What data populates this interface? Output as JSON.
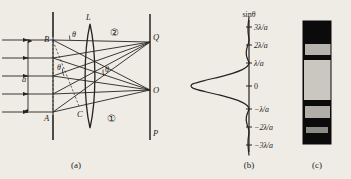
{
  "figure": {
    "background_color": "#efece6",
    "ink_color": "#262320"
  },
  "panel_a": {
    "caption": "(a)",
    "labels": {
      "slit_top": "B",
      "slit_bottom": "A",
      "path_point": "C",
      "lens": "L",
      "screen": "P",
      "focus_off_axis": "Q",
      "focus_axis": "O",
      "slit_width": "a",
      "angle_1": "θ",
      "angle_2": "θ",
      "angle_3": "θ",
      "beam_upper": "②",
      "beam_lower": "①"
    },
    "incoming_rays": 5,
    "rays_to_Q": 5,
    "rays_to_O": 5
  },
  "panel_b": {
    "caption": "(b)",
    "axis_label": "sinθ",
    "ticks": [
      "3λ/a",
      "2λ/a",
      "λ/a",
      "0",
      "−λ/a",
      "−2λ/a",
      "−3λ/a"
    ]
  },
  "panel_c": {
    "caption": "(c)",
    "description": "photograph of diffraction fringes",
    "dark_color": "#0b0b0b",
    "band_colors": [
      "#b6b4ac",
      "#c9c7bf",
      "#b0aea6",
      "#8e8c86"
    ]
  },
  "chart_data": {
    "type": "line",
    "xlabel": "Relative intensity I",
    "ylabel": "sinθ",
    "orientation": "horizontal-intensity-vertical-angle",
    "grid": false,
    "legend": false,
    "ylim": [
      -3,
      3
    ],
    "xlim": [
      0,
      1
    ],
    "tick_positions": [
      3,
      2,
      1,
      0,
      -1,
      -2,
      -3
    ],
    "tick_labels": [
      "3λ/a",
      "2λ/a",
      "λ/a",
      "0",
      "−λ/a",
      "−2λ/a",
      "−3λ/a"
    ],
    "peaks": [
      {
        "sin_theta": 0.0,
        "intensity": 1.0,
        "order": "central maximum"
      },
      {
        "sin_theta": 1.43,
        "intensity": 0.047,
        "order": "first secondary maximum"
      },
      {
        "sin_theta": -1.43,
        "intensity": 0.047,
        "order": "first secondary maximum"
      },
      {
        "sin_theta": 2.46,
        "intensity": 0.017,
        "order": "second secondary maximum"
      },
      {
        "sin_theta": -2.46,
        "intensity": 0.017,
        "order": "second secondary maximum"
      }
    ],
    "zeros": [
      1,
      -1,
      2,
      -2,
      3,
      -3
    ],
    "series": [
      {
        "name": "I/I0 = (sin(pi u)/(pi u))^2",
        "x": [
          -3.0,
          -2.8,
          -2.6,
          -2.46,
          -2.3,
          -2.1,
          -2.0,
          -1.85,
          -1.7,
          -1.55,
          -1.43,
          -1.3,
          -1.15,
          -1.0,
          -0.85,
          -0.7,
          -0.55,
          -0.4,
          -0.25,
          -0.1,
          0.0,
          0.1,
          0.25,
          0.4,
          0.55,
          0.7,
          0.85,
          1.0,
          1.15,
          1.3,
          1.43,
          1.55,
          1.7,
          1.85,
          2.0,
          2.1,
          2.3,
          2.46,
          2.6,
          2.8,
          3.0
        ],
        "y": [
          0.0,
          0.009,
          0.016,
          0.017,
          0.014,
          0.004,
          0.0,
          0.01,
          0.03,
          0.044,
          0.047,
          0.042,
          0.022,
          0.0,
          0.033,
          0.124,
          0.285,
          0.5,
          0.75,
          0.96,
          1.0,
          0.96,
          0.75,
          0.5,
          0.285,
          0.124,
          0.033,
          0.0,
          0.022,
          0.042,
          0.047,
          0.044,
          0.03,
          0.01,
          0.0,
          0.004,
          0.014,
          0.017,
          0.016,
          0.009,
          0.0
        ]
      }
    ]
  }
}
